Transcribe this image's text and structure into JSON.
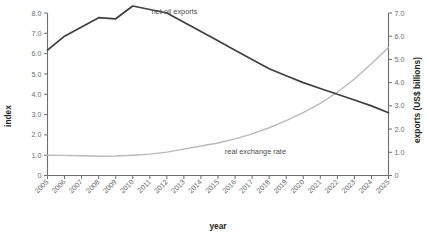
{
  "chart_data": {
    "type": "line",
    "title": "",
    "xlabel": "year",
    "ylabel": "index",
    "y2label": "exports (US$ billions)",
    "grid": false,
    "legend": "inline-annotations",
    "ylim": [
      0,
      8
    ],
    "y2lim": [
      0,
      7
    ],
    "yticks": [
      "0",
      "1.0",
      "2.0",
      "3.0",
      "4.0",
      "5.0",
      "6.0",
      "7.0",
      "8.0"
    ],
    "y2ticks": [
      "0",
      "1.0",
      "2.0",
      "3.0",
      "4.0",
      "5.0",
      "6.0",
      "7.0"
    ],
    "categories": [
      "2005",
      "2006",
      "2007",
      "2008",
      "2009",
      "2010",
      "2011",
      "2012",
      "2013",
      "2014",
      "2015",
      "2016",
      "2017",
      "2018",
      "2019",
      "2020",
      "2021",
      "2022",
      "2023",
      "2024",
      "2025"
    ],
    "series": [
      {
        "name": "net oil exports",
        "axis": "right",
        "color": "#3f3f42",
        "values": [
          5.4,
          6.0,
          6.4,
          6.8,
          6.75,
          7.3,
          7.15,
          7.0,
          6.6,
          6.2,
          5.8,
          5.4,
          5.0,
          4.6,
          4.3,
          4.0,
          3.75,
          3.5,
          3.25,
          3.0,
          2.7
        ]
      },
      {
        "name": "real exchange rate",
        "axis": "left",
        "color": "#b9babc",
        "values": [
          1.0,
          0.99,
          0.97,
          0.95,
          0.96,
          1.0,
          1.05,
          1.15,
          1.3,
          1.45,
          1.6,
          1.8,
          2.05,
          2.35,
          2.7,
          3.1,
          3.55,
          4.1,
          4.75,
          5.5,
          6.3
        ]
      }
    ],
    "annotations": [
      {
        "text": "net oil exports",
        "x": 2011.1,
        "y": 6.95
      },
      {
        "text": "real exchange rate",
        "x": 2015.4,
        "y": 1.05
      }
    ]
  }
}
